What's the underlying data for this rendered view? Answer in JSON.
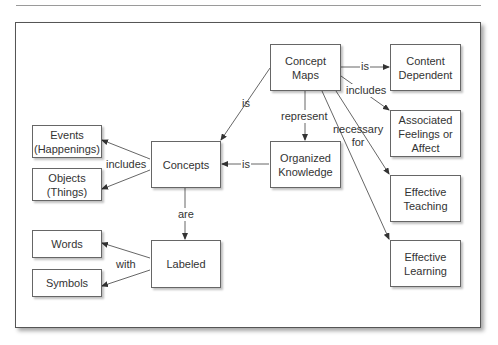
{
  "caption": {
    "visible_text": ""
  },
  "diagram": {
    "nodes": {
      "concept_maps": "Concept\nMaps",
      "content_dependent": "Content\nDependent",
      "associated_feelings": "Associated\nFeelings or\nAffect",
      "effective_teaching": "Effective\nTeaching",
      "effective_learning": "Effective\nLearning",
      "organized_knowledge": "Organized\nKnowledge",
      "concepts": "Concepts",
      "events": "Events\n(Happenings)",
      "objects": "Objects\n(Things)",
      "labeled": "Labeled",
      "words": "Words",
      "symbols": "Symbols"
    },
    "edges": {
      "cm_to_cd": "is",
      "cm_to_af": "includes",
      "cm_to_ok": "represent",
      "cm_to_eff": "necessary\nfor",
      "cm_to_concepts": "is",
      "ok_to_concepts": "is",
      "concepts_includes": "includes",
      "concepts_to_labeled": "are",
      "labeled_with": "with"
    }
  },
  "colors": {
    "line": "#444444",
    "box_border": "#666666",
    "text": "#333333"
  }
}
